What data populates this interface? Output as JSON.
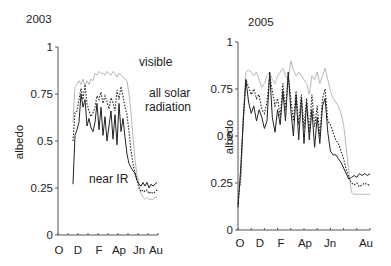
{
  "chart_data": [
    {
      "type": "line",
      "title": "2003",
      "xlabel": "",
      "ylabel": "albedo",
      "ylim": [
        0,
        1
      ],
      "yticks": [
        "0",
        "0.25",
        "0.5",
        "0.75",
        "1"
      ],
      "xticks": [
        "O",
        "D",
        "F",
        "Ap",
        "Jn",
        "Au"
      ],
      "grid": false,
      "annotations": [
        "visible",
        "all solar radiation",
        "near IR"
      ],
      "x": [
        0.15,
        0.17,
        0.19,
        0.21,
        0.23,
        0.25,
        0.27,
        0.29,
        0.31,
        0.33,
        0.35,
        0.37,
        0.39,
        0.41,
        0.43,
        0.45,
        0.47,
        0.49,
        0.51,
        0.53,
        0.55,
        0.57,
        0.59,
        0.61,
        0.63,
        0.65,
        0.67,
        0.69,
        0.71,
        0.73,
        0.75,
        0.77,
        0.79,
        0.81,
        0.83,
        0.85,
        0.87,
        0.89,
        0.91,
        0.93,
        0.95,
        0.97,
        0.99
      ],
      "series": [
        {
          "name": "visible",
          "style": "gray solid",
          "values": [
            0.6,
            0.79,
            0.8,
            0.82,
            0.8,
            0.83,
            0.79,
            0.82,
            0.8,
            0.83,
            0.82,
            0.86,
            0.85,
            0.87,
            0.86,
            0.86,
            0.85,
            0.87,
            0.86,
            0.85,
            0.87,
            0.86,
            0.84,
            0.86,
            0.85,
            0.84,
            0.83,
            0.82,
            0.75,
            0.65,
            0.52,
            0.4,
            0.32,
            0.27,
            0.22,
            0.2,
            0.19,
            0.2,
            0.19,
            0.19,
            0.19,
            0.2,
            0.2
          ]
        },
        {
          "name": "all solar radiation",
          "style": "black dotted",
          "values": [
            0.5,
            0.65,
            0.66,
            0.72,
            0.78,
            0.72,
            0.8,
            0.7,
            0.66,
            0.63,
            0.65,
            0.68,
            0.74,
            0.72,
            0.76,
            0.7,
            0.74,
            0.71,
            0.67,
            0.73,
            0.7,
            0.66,
            0.77,
            0.72,
            0.79,
            0.74,
            0.68,
            0.64,
            0.55,
            0.45,
            0.38,
            0.33,
            0.29,
            0.25,
            0.23,
            0.24,
            0.23,
            0.24,
            0.22,
            0.23,
            0.22,
            0.23,
            0.24
          ]
        },
        {
          "name": "near IR",
          "style": "black solid",
          "values": [
            0.27,
            0.53,
            0.56,
            0.6,
            0.75,
            0.68,
            0.72,
            0.58,
            0.62,
            0.57,
            0.55,
            0.6,
            0.7,
            0.56,
            0.68,
            0.53,
            0.63,
            0.5,
            0.58,
            0.66,
            0.51,
            0.64,
            0.48,
            0.7,
            0.55,
            0.62,
            0.52,
            0.43,
            0.38,
            0.36,
            0.34,
            0.33,
            0.29,
            0.27,
            0.26,
            0.28,
            0.26,
            0.28,
            0.25,
            0.27,
            0.26,
            0.27,
            0.28
          ]
        }
      ]
    },
    {
      "type": "line",
      "title": "2005",
      "xlabel": "",
      "ylabel": "albedo",
      "ylim": [
        0,
        1
      ],
      "yticks": [
        "0",
        "0.25",
        "0.5",
        "0.75",
        "1"
      ],
      "xticks": [
        "O",
        "D",
        "F",
        "Ap",
        "Jn",
        "Au"
      ],
      "grid": false,
      "x": [
        0.0,
        0.02,
        0.04,
        0.06,
        0.08,
        0.1,
        0.12,
        0.14,
        0.16,
        0.18,
        0.2,
        0.22,
        0.24,
        0.26,
        0.28,
        0.3,
        0.32,
        0.34,
        0.36,
        0.38,
        0.4,
        0.42,
        0.44,
        0.46,
        0.48,
        0.5,
        0.52,
        0.54,
        0.56,
        0.58,
        0.6,
        0.62,
        0.64,
        0.66,
        0.68,
        0.7,
        0.72,
        0.74,
        0.76,
        0.78,
        0.8,
        0.82,
        0.84,
        0.86,
        0.88,
        0.9,
        0.92,
        0.94,
        0.96,
        0.98,
        1.0
      ],
      "series": [
        {
          "name": "visible",
          "style": "gray solid",
          "values": [
            0.22,
            0.24,
            0.6,
            0.84,
            0.85,
            0.84,
            0.82,
            0.84,
            0.8,
            0.76,
            0.78,
            0.82,
            0.84,
            0.8,
            0.78,
            0.82,
            0.84,
            0.86,
            0.82,
            0.8,
            0.9,
            0.85,
            0.82,
            0.84,
            0.82,
            0.8,
            0.78,
            0.72,
            0.82,
            0.8,
            0.84,
            0.78,
            0.82,
            0.86,
            0.8,
            0.74,
            0.7,
            0.68,
            0.66,
            0.62,
            0.56,
            0.44,
            0.3,
            0.2,
            0.19,
            0.19,
            0.19,
            0.19,
            0.19,
            0.19,
            0.19
          ]
        },
        {
          "name": "all solar radiation",
          "style": "black dotted",
          "values": [
            0.14,
            0.28,
            0.6,
            0.8,
            0.76,
            0.72,
            0.75,
            0.7,
            0.72,
            0.64,
            0.62,
            0.68,
            0.82,
            0.74,
            0.66,
            0.7,
            0.6,
            0.78,
            0.64,
            0.82,
            0.7,
            0.58,
            0.74,
            0.56,
            0.72,
            0.54,
            0.7,
            0.52,
            0.72,
            0.55,
            0.66,
            0.5,
            0.7,
            0.75,
            0.58,
            0.56,
            0.52,
            0.48,
            0.46,
            0.42,
            0.38,
            0.32,
            0.28,
            0.25,
            0.24,
            0.25,
            0.23,
            0.24,
            0.25,
            0.24,
            0.24
          ]
        },
        {
          "name": "near IR",
          "style": "black solid",
          "values": [
            0.12,
            0.32,
            0.58,
            0.8,
            0.68,
            0.62,
            0.66,
            0.58,
            0.64,
            0.6,
            0.54,
            0.58,
            0.84,
            0.6,
            0.52,
            0.64,
            0.56,
            0.74,
            0.58,
            0.84,
            0.64,
            0.5,
            0.72,
            0.48,
            0.7,
            0.46,
            0.68,
            0.48,
            0.64,
            0.44,
            0.6,
            0.46,
            0.66,
            0.7,
            0.52,
            0.42,
            0.4,
            0.4,
            0.38,
            0.36,
            0.33,
            0.3,
            0.27,
            0.28,
            0.29,
            0.28,
            0.3,
            0.29,
            0.3,
            0.29,
            0.3
          ]
        }
      ]
    }
  ]
}
